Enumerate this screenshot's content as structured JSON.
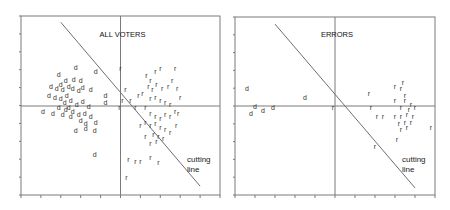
{
  "chart_data": [
    {
      "type": "scatter",
      "title": "ALL VOTERS",
      "xlabel": "",
      "ylabel": "",
      "grid": false,
      "axes_through_origin": true,
      "xlim": [
        -1,
        1
      ],
      "ylim": [
        -1,
        1
      ],
      "x_ticks_count": 11,
      "y_ticks_count": 10,
      "annotation": "cutting line",
      "cutting_line": {
        "x1": -0.6,
        "y1": 0.93,
        "x2": 0.8,
        "y2": -0.9
      },
      "series": [
        {
          "name": "d",
          "marker": "d",
          "points": [
            [
              -0.62,
              0.35
            ],
            [
              -0.45,
              0.43
            ],
            [
              -0.55,
              0.28
            ],
            [
              -0.6,
              0.24
            ],
            [
              -0.64,
              0.2
            ],
            [
              -0.58,
              0.18
            ],
            [
              -0.52,
              0.22
            ],
            [
              -0.48,
              0.19
            ],
            [
              -0.42,
              0.17
            ],
            [
              -0.38,
              0.21
            ],
            [
              -0.4,
              0.28
            ],
            [
              -0.47,
              0.3
            ],
            [
              -0.54,
              0.12
            ],
            [
              -0.6,
              0.08
            ],
            [
              -0.66,
              0.1
            ],
            [
              -0.56,
              0.04
            ],
            [
              -0.5,
              0.06
            ],
            [
              -0.44,
              0.02
            ],
            [
              -0.38,
              0.05
            ],
            [
              -0.32,
              0.0
            ],
            [
              -0.62,
              -0.02
            ],
            [
              -0.55,
              -0.04
            ],
            [
              -0.48,
              -0.06
            ],
            [
              -0.42,
              -0.09
            ],
            [
              -0.36,
              -0.08
            ],
            [
              -0.3,
              -0.12
            ],
            [
              -0.4,
              -0.16
            ],
            [
              -0.5,
              -0.12
            ],
            [
              -0.58,
              -0.1
            ],
            [
              -0.68,
              -0.08
            ],
            [
              -0.35,
              -0.2
            ],
            [
              -0.25,
              -0.18
            ],
            [
              -0.45,
              -0.28
            ],
            [
              -0.35,
              -0.25
            ],
            [
              -0.26,
              -0.28
            ],
            [
              -0.3,
              0.18
            ],
            [
              -0.15,
              0.12
            ],
            [
              -0.15,
              0.04
            ],
            [
              -0.78,
              -0.06
            ],
            [
              -0.25,
              0.38
            ],
            [
              -0.26,
              -0.55
            ],
            [
              -0.72,
              0.12
            ],
            [
              -0.7,
              0.22
            ],
            [
              -0.52,
              -0.02
            ]
          ]
        },
        {
          "name": "r",
          "marker": "r",
          "points": [
            [
              0.0,
              0.42
            ],
            [
              0.05,
              0.18
            ],
            [
              0.02,
              0.06
            ],
            [
              -0.01,
              -0.02
            ],
            [
              0.1,
              0.06
            ],
            [
              0.15,
              -0.02
            ],
            [
              0.18,
              0.12
            ],
            [
              0.22,
              0.14
            ],
            [
              0.26,
              0.34
            ],
            [
              0.3,
              0.28
            ],
            [
              0.35,
              0.38
            ],
            [
              0.4,
              0.42
            ],
            [
              0.28,
              0.22
            ],
            [
              0.32,
              0.18
            ],
            [
              0.36,
              0.24
            ],
            [
              0.42,
              0.2
            ],
            [
              0.48,
              0.22
            ],
            [
              0.52,
              0.28
            ],
            [
              0.55,
              0.42
            ],
            [
              0.57,
              0.2
            ],
            [
              0.6,
              0.1
            ],
            [
              0.3,
              0.08
            ],
            [
              0.35,
              0.1
            ],
            [
              0.4,
              0.06
            ],
            [
              0.45,
              0.04
            ],
            [
              0.5,
              0.02
            ],
            [
              0.55,
              -0.06
            ],
            [
              0.25,
              -0.02
            ],
            [
              0.3,
              -0.08
            ],
            [
              0.35,
              -0.12
            ],
            [
              0.4,
              -0.14
            ],
            [
              0.45,
              -0.1
            ],
            [
              0.5,
              -0.12
            ],
            [
              0.25,
              -0.18
            ],
            [
              0.3,
              -0.22
            ],
            [
              0.35,
              -0.2
            ],
            [
              0.4,
              -0.24
            ],
            [
              0.45,
              -0.26
            ],
            [
              0.5,
              -0.3
            ],
            [
              0.33,
              -0.32
            ],
            [
              0.38,
              -0.34
            ],
            [
              0.43,
              -0.36
            ],
            [
              0.56,
              -0.22
            ],
            [
              0.58,
              -0.08
            ],
            [
              0.2,
              -0.22
            ],
            [
              0.25,
              -0.34
            ],
            [
              0.3,
              -0.42
            ],
            [
              0.36,
              -0.4
            ],
            [
              0.08,
              -0.6
            ],
            [
              0.15,
              -0.62
            ],
            [
              0.2,
              -0.62
            ],
            [
              0.06,
              -0.8
            ],
            [
              0.3,
              -0.58
            ],
            [
              0.38,
              -0.64
            ]
          ]
        }
      ]
    },
    {
      "type": "scatter",
      "title": "ERRORS",
      "xlabel": "",
      "ylabel": "",
      "grid": false,
      "axes_through_origin": true,
      "xlim": [
        -1,
        1
      ],
      "ylim": [
        -1,
        1
      ],
      "x_ticks_count": 11,
      "y_ticks_count": 10,
      "annotation": "cutting line",
      "cutting_line": {
        "x1": -0.6,
        "y1": 0.92,
        "x2": 0.8,
        "y2": -0.92
      },
      "series": [
        {
          "name": "d",
          "marker": "d",
          "points": [
            [
              -0.88,
              0.2
            ],
            [
              -0.3,
              0.1
            ],
            [
              -0.62,
              -0.02
            ],
            [
              -0.72,
              -0.05
            ],
            [
              -0.84,
              -0.08
            ],
            [
              -0.8,
              0.0
            ]
          ]
        },
        {
          "name": "r",
          "marker": "r",
          "points": [
            [
              -0.02,
              -0.02
            ],
            [
              0.34,
              0.14
            ],
            [
              0.36,
              -0.02
            ],
            [
              0.42,
              -0.12
            ],
            [
              0.48,
              -0.12
            ],
            [
              0.6,
              0.22
            ],
            [
              0.66,
              0.2
            ],
            [
              0.7,
              0.12
            ],
            [
              0.6,
              0.06
            ],
            [
              0.7,
              0.06
            ],
            [
              0.76,
              0.02
            ],
            [
              0.66,
              -0.02
            ],
            [
              0.74,
              -0.04
            ],
            [
              0.8,
              -0.02
            ],
            [
              0.6,
              -0.12
            ],
            [
              0.66,
              -0.12
            ],
            [
              0.72,
              -0.1
            ],
            [
              0.78,
              -0.12
            ],
            [
              0.64,
              -0.2
            ],
            [
              0.7,
              -0.18
            ],
            [
              0.76,
              -0.18
            ],
            [
              0.66,
              -0.26
            ],
            [
              0.72,
              -0.24
            ],
            [
              0.96,
              -0.24
            ],
            [
              0.62,
              -0.38
            ],
            [
              0.4,
              -0.46
            ],
            [
              0.68,
              0.26
            ]
          ]
        }
      ]
    }
  ]
}
